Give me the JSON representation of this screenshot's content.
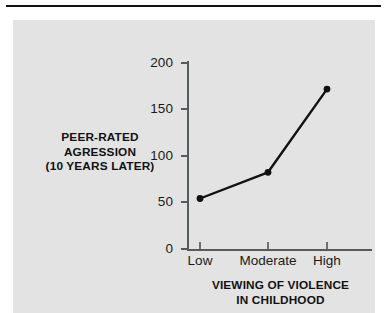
{
  "figure": {
    "panel_color": "#e3e3e3",
    "rule_color": "#111111",
    "axis_color": "#555a5c",
    "series_color": "#111111"
  },
  "chart_data": {
    "type": "line",
    "title": "",
    "subtitle": "",
    "categories": [
      "Low",
      "Moderate",
      "High"
    ],
    "values": [
      54,
      82,
      171
    ],
    "series": [
      {
        "name": "Peer-rated agression (10 years later)",
        "values": [
          54,
          82,
          171
        ]
      }
    ],
    "xlabel": "VIEWING OF VIOLENCE IN CHILDHOOD",
    "xlabel_lines": [
      "VIEWING OF VIOLENCE",
      "IN CHILDHOOD"
    ],
    "ylabel": "PEER-RATED AGRESSION (10 YEARS LATER)",
    "ylabel_lines": [
      "PEER-RATED",
      "AGRESSION",
      "(10 YEARS LATER)"
    ],
    "ylim": [
      0,
      200
    ],
    "yticks": [
      0,
      50,
      100,
      150,
      200
    ],
    "ytick_labels": [
      "0",
      "50",
      "100",
      "150",
      "200"
    ],
    "grid": false,
    "legend": false,
    "legend_position": "none",
    "markers": "filled-circle",
    "annotations": []
  }
}
